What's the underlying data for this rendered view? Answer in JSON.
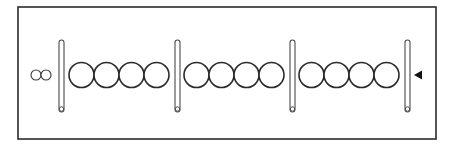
{
  "diagram": {
    "type": "abacus-like sequence of circles separated by rods",
    "frame": {
      "x": 18,
      "y": 7,
      "width": 418,
      "height": 132,
      "stroke": "#2b2b2b"
    },
    "small_circles": [
      {
        "cx": 36,
        "cy": 75,
        "r": 5
      },
      {
        "cx": 46,
        "cy": 75,
        "r": 5
      }
    ],
    "rods": [
      {
        "x": 59,
        "y_top": 40,
        "y_bottom": 112,
        "width": 5
      },
      {
        "x": 175,
        "y_top": 40,
        "y_bottom": 112,
        "width": 5
      },
      {
        "x": 290,
        "y_top": 40,
        "y_bottom": 112,
        "width": 5
      },
      {
        "x": 405,
        "y_top": 40,
        "y_bottom": 112,
        "width": 5
      }
    ],
    "circle_groups": [
      {
        "count": 4,
        "start_cx": 81.5,
        "cy": 75,
        "r": 12.5,
        "spacing": 25
      },
      {
        "count": 4,
        "start_cx": 196.5,
        "cy": 75,
        "r": 12.5,
        "spacing": 25
      },
      {
        "count": 4,
        "start_cx": 311.5,
        "cy": 75,
        "r": 12.5,
        "spacing": 25
      }
    ],
    "pointer": {
      "shape": "triangle-left",
      "tip_x": 414,
      "base_x": 422,
      "cy": 75,
      "half_height": 4.5,
      "color": "#111111"
    },
    "colors": {
      "stroke": "#2a2a2a",
      "background": "#ffffff"
    }
  }
}
